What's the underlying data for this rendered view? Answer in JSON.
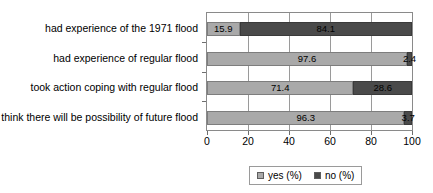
{
  "chart_data": {
    "type": "bar",
    "orientation": "horizontal",
    "stacked": true,
    "stack_total": 100,
    "title": "",
    "subtitle": "",
    "xlabel": "",
    "ylabel": "",
    "xlim": [
      0,
      100
    ],
    "xticks": [
      0,
      20,
      40,
      60,
      80,
      100
    ],
    "xtick_labels": [
      "0",
      "20",
      "40",
      "60",
      "80",
      "100"
    ],
    "grid": true,
    "grid_axis": "x",
    "legend_position": "bottom-center",
    "categories": [
      "had experience of the 1971 flood",
      "had experience of regular flood",
      "took action coping with regular flood",
      "think there will be possibility of future flood"
    ],
    "series": [
      {
        "name": "yes (%)",
        "color": "#a9a9a9",
        "values": [
          15.9,
          97.6,
          71.4,
          96.3
        ],
        "labels": [
          "15.9",
          "97.6",
          "71.4",
          "96.3"
        ]
      },
      {
        "name": "no (%)",
        "color": "#4a4a4a",
        "values": [
          84.1,
          2.4,
          28.6,
          3.7
        ],
        "labels": [
          "84.1",
          "2.4",
          "28.6",
          "3.7"
        ]
      }
    ]
  },
  "legend": {
    "items": [
      {
        "label": "yes (%)",
        "swatch": "legend-swatch-yes"
      },
      {
        "label": "no (%)",
        "swatch": "legend-swatch-no"
      }
    ]
  },
  "colors": {
    "yes": "#a9a9a9",
    "no": "#4a4a4a",
    "axis": "#6e6e6e",
    "grid": "#9a9a9a",
    "background": "#ffffff",
    "text": "#000000"
  }
}
